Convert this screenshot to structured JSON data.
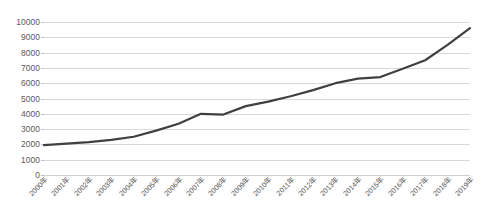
{
  "chart_data": {
    "type": "line",
    "title": "",
    "subtitle": "",
    "xlabel": "",
    "ylabel": "",
    "categories": [
      "2000年",
      "2001年",
      "2002年",
      "2003年",
      "2004年",
      "2005年",
      "2006年",
      "2007年",
      "2008年",
      "2009年",
      "2010年",
      "2011年",
      "2012年",
      "2013年",
      "2014年",
      "2015年",
      "2016年",
      "2017年",
      "2018年",
      "2019年"
    ],
    "values": [
      1950,
      2050,
      2150,
      2300,
      2500,
      2900,
      3350,
      4000,
      3950,
      4500,
      4800,
      5150,
      5550,
      6000,
      6300,
      6400,
      6950,
      7500,
      8500,
      9600
    ],
    "series": [
      {
        "name": "",
        "values": [
          1950,
          2050,
          2150,
          2300,
          2500,
          2900,
          3350,
          4000,
          3950,
          4500,
          4800,
          5150,
          5550,
          6000,
          6300,
          6400,
          6950,
          7500,
          8500,
          9600
        ]
      }
    ],
    "ylim": [
      0,
      10000
    ],
    "y_ticks": [
      0,
      1000,
      2000,
      3000,
      4000,
      5000,
      6000,
      7000,
      8000,
      9000,
      10000
    ],
    "y_tick_labels": [
      "0",
      "1000",
      "2000",
      "3000",
      "4000",
      "5000",
      "6000",
      "7000",
      "8000",
      "9000",
      "10000"
    ],
    "grid": true,
    "grid_axis": "y",
    "legend": false,
    "legend_position": "none",
    "line_color": "#404040",
    "grid_color": "#d9d9d9",
    "text_color": "#595959",
    "background_color": "#ffffff",
    "line_width": 2.2,
    "markers": false,
    "x_tick_rotation": -45
  }
}
